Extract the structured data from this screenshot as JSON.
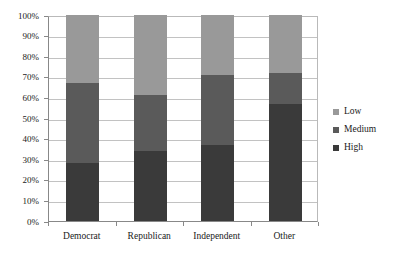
{
  "chart_data": {
    "type": "bar",
    "subtype": "stacked-percent",
    "title": "",
    "subtitle": "",
    "xlabel": "",
    "ylabel": "",
    "categories": [
      "Democrat",
      "Republican",
      "Independent",
      "Other"
    ],
    "series": [
      {
        "name": "Low",
        "color": "#999999",
        "values": [
          33,
          39,
          29,
          28
        ]
      },
      {
        "name": "Medium",
        "color": "#5a5a5a",
        "values": [
          39,
          27,
          34,
          15
        ]
      },
      {
        "name": "High",
        "color": "#3a3a3a",
        "values": [
          28,
          34,
          37,
          57
        ]
      }
    ],
    "stack_order_bottom_to_top": [
      "High",
      "Medium",
      "Low"
    ],
    "cumulative_tops": {
      "Democrat": {
        "High": 28,
        "Medium": 67,
        "Low": 100
      },
      "Republican": {
        "High": 34,
        "Medium": 61,
        "Low": 100
      },
      "Independent": {
        "High": 37,
        "Medium": 71,
        "Low": 100
      },
      "Other": {
        "High": 57,
        "Medium": 72,
        "Low": 100
      }
    },
    "ylim": [
      0,
      100
    ],
    "ytick_step": 10,
    "ytick_labels": [
      "0%",
      "10%",
      "20%",
      "30%",
      "40%",
      "50%",
      "60%",
      "70%",
      "80%",
      "90%",
      "100%"
    ],
    "ytick_values": [
      0,
      10,
      20,
      30,
      40,
      50,
      60,
      70,
      80,
      90,
      100
    ],
    "grid": "horizontal",
    "legend_position": "right",
    "legend_entries": [
      "Low",
      "Medium",
      "High"
    ],
    "background_color": "#ffffff",
    "gridline_color": "#c2c2c2",
    "axis_color": "#888888"
  }
}
